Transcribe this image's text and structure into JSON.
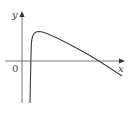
{
  "graph": {
    "x_axis_label": "x",
    "y_axis_label": "y",
    "origin_label": "0",
    "axis_color": "#555555",
    "curve_color": "#333333",
    "curve_description": "Curve rising steeply from negative infinity near the y-axis, reaching a maximum, then decreasing and crossing the x-axis"
  }
}
